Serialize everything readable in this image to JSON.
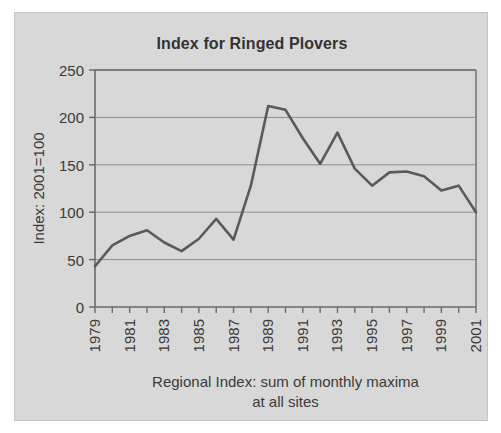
{
  "figure": {
    "panel_bg": "#d8d8d8",
    "page_bg": "#ffffff",
    "line_color": "#5a5a5a",
    "axis_color": "#6b6b6b",
    "grid_color": "#8f8f8f",
    "text_color": "#3a3a3a"
  },
  "chart_data": {
    "type": "line",
    "title": "Index for Ringed Plovers",
    "xlabel": "Regional Index: sum of monthly maxima at all sites",
    "xlabel_line1": "Regional Index: sum of monthly maxima",
    "xlabel_line2": "at all sites",
    "ylabel": "Index: 2001=100",
    "ylim": [
      0,
      250
    ],
    "ytick_values": [
      0,
      50,
      100,
      150,
      200,
      250
    ],
    "ytick_labels": [
      "0",
      "50",
      "100",
      "150",
      "200",
      "250"
    ],
    "grid": true,
    "grid_axis": "y",
    "legend": false,
    "xlim": [
      1979,
      2001
    ],
    "x": [
      1979,
      1980,
      1981,
      1982,
      1983,
      1984,
      1985,
      1986,
      1987,
      1988,
      1989,
      1990,
      1991,
      1992,
      1993,
      1994,
      1995,
      1996,
      1997,
      1998,
      1999,
      2000,
      2001
    ],
    "xtick_values": [
      1979,
      1980,
      1981,
      1982,
      1983,
      1984,
      1985,
      1986,
      1987,
      1988,
      1989,
      1990,
      1991,
      1992,
      1993,
      1994,
      1995,
      1996,
      1997,
      1998,
      1999,
      2000,
      2001
    ],
    "xtick_labels": [
      "1979",
      "",
      "1981",
      "",
      "1983",
      "",
      "1985",
      "",
      "1987",
      "",
      "1989",
      "",
      "1991",
      "",
      "1993",
      "",
      "1995",
      "",
      "1997",
      "",
      "1999",
      "",
      "2001"
    ],
    "xtick_labels_shown": [
      "1979",
      "1981",
      "1983",
      "1985",
      "1987",
      "1989",
      "1991",
      "1993",
      "1995",
      "1997",
      "1999",
      "2001"
    ],
    "values": [
      43,
      65,
      75,
      81,
      68,
      59,
      72,
      93,
      71,
      128,
      212,
      208,
      178,
      151,
      184,
      146,
      128,
      142,
      143,
      138,
      123,
      128,
      100
    ],
    "series": [
      {
        "name": "Ringed Plover index",
        "values": [
          43,
          65,
          75,
          81,
          68,
          59,
          72,
          93,
          71,
          128,
          212,
          208,
          178,
          151,
          184,
          146,
          128,
          142,
          143,
          138,
          123,
          128,
          100
        ]
      }
    ]
  }
}
